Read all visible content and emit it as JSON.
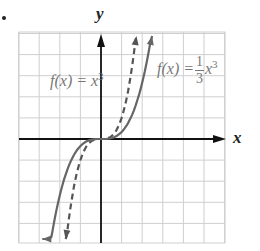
{
  "chart_data": {
    "type": "line",
    "title": "",
    "xlabel": "x",
    "ylabel": "y",
    "grid": true,
    "xlim": [
      -4,
      6
    ],
    "ylim": [
      -5,
      5
    ],
    "series": [
      {
        "name": "f(x) = x^3",
        "style": "dashed",
        "color": "#555555",
        "x": [
          -1.7,
          -1.5,
          -1.0,
          -0.5,
          0,
          0.5,
          1.0,
          1.5,
          1.72
        ],
        "y": [
          -4.9,
          -3.375,
          -1.0,
          -0.125,
          0,
          0.125,
          1.0,
          3.375,
          5.1
        ]
      },
      {
        "name": "f(x) = (1/3)x^3",
        "style": "solid",
        "color": "#666666",
        "x": [
          -2.85,
          -2.5,
          -2.0,
          -1.0,
          0,
          1.0,
          2.0,
          2.48
        ],
        "y": [
          -7.7,
          -5.2,
          -2.667,
          -0.333,
          0,
          0.333,
          2.667,
          5.1
        ]
      }
    ],
    "annotations": [
      "f(x) = x^3",
      "f(x) = 1/3 x^3"
    ]
  },
  "labels": {
    "y_axis": "y",
    "x_axis": "x",
    "dashed_fx": "f(x) = x",
    "dashed_exp": "3",
    "solid_fx": "f(x) =",
    "solid_num": "1",
    "solid_den": "3",
    "solid_var": "x",
    "solid_exp": "3"
  },
  "colors": {
    "grid": "#cfcfcf",
    "axis": "#111111",
    "curve": "#666666",
    "label": "#777777"
  }
}
